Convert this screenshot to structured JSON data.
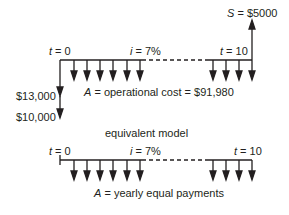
{
  "top_diagram": {
    "start_label": {
      "var": "t",
      "eq": " = 0"
    },
    "rate_label": {
      "var": "i",
      "eq": " = 7%"
    },
    "end_label": {
      "var": "t",
      "eq": " = 10"
    },
    "salvage_label": {
      "var": "S",
      "eq": " = $5000"
    },
    "cost_13000": "$13,000",
    "cost_10000": "$10,000",
    "annuity_label": {
      "var": "A",
      "eq": " = operational cost = $91,980"
    }
  },
  "caption": "equivalent model",
  "bottom_diagram": {
    "start_label": {
      "var": "t",
      "eq": " = 0"
    },
    "rate_label": {
      "var": "i",
      "eq": " = 7%"
    },
    "end_label": {
      "var": "t",
      "eq": " = 10"
    },
    "annuity_label": {
      "var": "A",
      "eq": " = yearly equal payments"
    }
  },
  "colors": {
    "ink": "#231f20",
    "background": "#ffffff"
  }
}
